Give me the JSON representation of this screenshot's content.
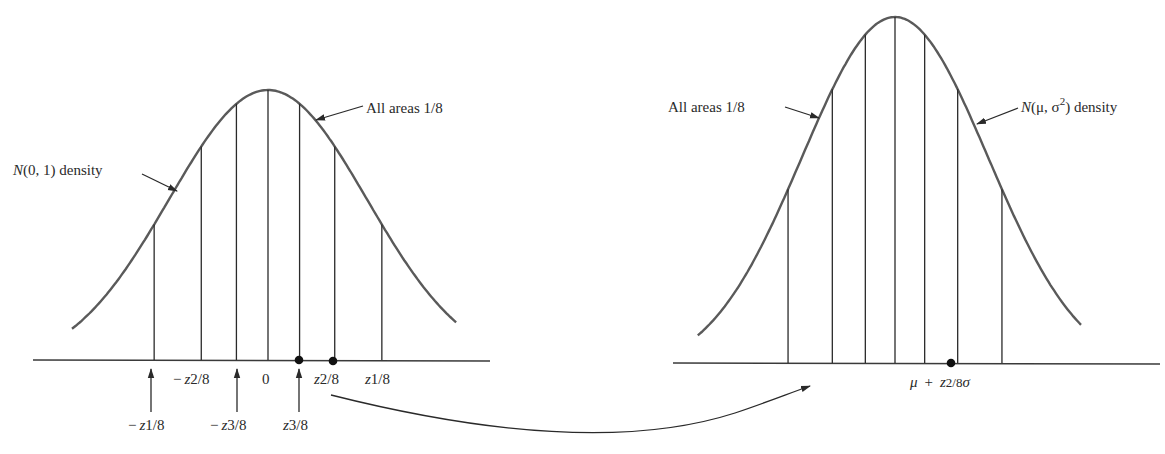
{
  "left_panel": {
    "curve_label": "N(0, 1) density",
    "areas_label": "All areas 1/8",
    "quantiles": [
      -1.15,
      -0.674,
      -0.319,
      0,
      0.319,
      0.674,
      1.15
    ],
    "tick_labels_upper": [
      {
        "name": "-z2/8",
        "minus": "−",
        "z": "z",
        "sub": "2/8"
      },
      {
        "name": "0",
        "text": "0"
      },
      {
        "name": "z2/8",
        "z": "z",
        "sub": "2/8"
      },
      {
        "name": "z1/8",
        "z": "z",
        "sub": "1/8"
      }
    ],
    "tick_labels_lower": [
      {
        "name": "-z1/8",
        "minus": "−",
        "z": "z",
        "sub": "1/8"
      },
      {
        "name": "-z3/8",
        "minus": "−",
        "z": "z",
        "sub": "3/8"
      },
      {
        "name": "z3/8",
        "z": "z",
        "sub": "3/8"
      }
    ],
    "highlighted_points": [
      "z3/8",
      "z2/8"
    ]
  },
  "right_panel": {
    "curve_label_N": "N",
    "curve_label_args": "(μ, σ",
    "curve_label_sup": "2",
    "curve_label_rest": ") density",
    "areas_label": "All areas 1/8",
    "quantiles": [
      -1.15,
      -0.674,
      -0.319,
      0,
      0.319,
      0.674,
      1.15
    ],
    "point_label": {
      "mu": "μ",
      "plus": "+",
      "z": "z",
      "sub": "2/8",
      "sigma": "σ"
    },
    "highlighted_points": [
      "mu + z2/8 sigma"
    ]
  },
  "connector": {
    "from": "z2/8",
    "to": "mu + z2/8 sigma"
  }
}
